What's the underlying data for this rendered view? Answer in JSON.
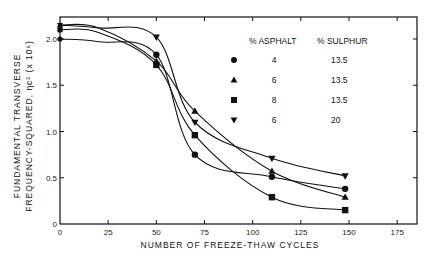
{
  "chart_data": {
    "type": "line",
    "title": "",
    "xlabel": "NUMBER OF FREEZE-THAW CYCLES",
    "ylabel_line1": "FUNDAMENTAL TRANSVERSE",
    "ylabel_line2": "FREQUENCY-SQUARED, ηc² (x 10⁶)",
    "xlim": [
      0,
      185
    ],
    "ylim": [
      0,
      2.2
    ],
    "x_ticks": [
      0,
      25,
      50,
      75,
      100,
      125,
      150,
      175
    ],
    "x_tick_labels": [
      "0",
      "25",
      "50",
      "75",
      "100",
      "125",
      "150",
      "175"
    ],
    "y_ticks": [
      0,
      0.5,
      1.0,
      1.5,
      2.0
    ],
    "y_tick_labels": [
      "0",
      "0.5",
      "1.0",
      "1.5",
      "2.0"
    ],
    "grid": false,
    "legend_position": "upper right (inside)",
    "legend_headers": [
      "% ASPHALT",
      "% SULPHUR"
    ],
    "series": [
      {
        "name": "4% asphalt, 13.5% sulphur",
        "marker": "circle",
        "asphalt": "4",
        "sulphur": "13.5",
        "x": [
          0,
          50,
          70,
          110,
          148
        ],
        "values": [
          2.0,
          1.83,
          0.75,
          0.51,
          0.38
        ]
      },
      {
        "name": "6% asphalt, 13.5% sulphur",
        "marker": "triangle-up",
        "asphalt": "6",
        "sulphur": "13.5",
        "x": [
          0,
          50,
          70,
          110,
          148
        ],
        "values": [
          2.15,
          1.76,
          1.22,
          0.57,
          0.29
        ]
      },
      {
        "name": "8% asphalt, 13.5% sulphur",
        "marker": "square",
        "asphalt": "8",
        "sulphur": "13.5",
        "x": [
          0,
          50,
          70,
          110,
          148
        ],
        "values": [
          2.1,
          1.72,
          0.96,
          0.29,
          0.15
        ]
      },
      {
        "name": "6% asphalt, 20% sulphur",
        "marker": "triangle-down",
        "asphalt": "6",
        "sulphur": "20",
        "x": [
          0,
          50,
          70,
          110,
          148
        ],
        "values": [
          2.15,
          2.02,
          1.1,
          0.71,
          0.52
        ]
      }
    ]
  }
}
